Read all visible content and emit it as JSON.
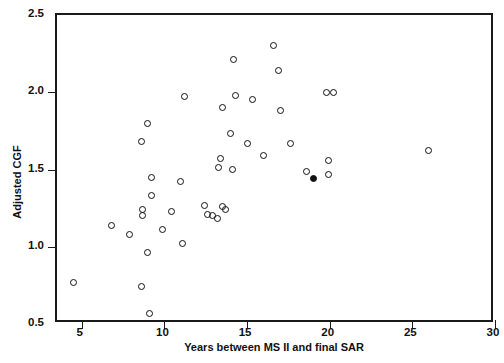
{
  "chart_data": {
    "type": "scatter",
    "title": "",
    "xlabel": "Years between MS II and final SAR",
    "ylabel": "Adjusted CGF",
    "xlim": [
      3.5,
      30
    ],
    "ylim": [
      0.5,
      2.5
    ],
    "xticks": [
      5,
      10,
      15,
      20,
      25,
      30
    ],
    "xticklabels": [
      "5",
      "10",
      "15",
      "20",
      "25",
      "30"
    ],
    "yticks": [
      0.5,
      1.0,
      1.5,
      2.0,
      2.5
    ],
    "yticklabels": [
      "0.5",
      "1.0",
      "1.5",
      "2.0",
      "2.5"
    ],
    "grid": false,
    "legend": null,
    "marker": "open-circle",
    "marker_color": "#111111",
    "points": [
      {
        "x": 4.5,
        "y": 0.77,
        "filled": false
      },
      {
        "x": 6.8,
        "y": 1.14,
        "filled": false
      },
      {
        "x": 7.9,
        "y": 1.08,
        "filled": false
      },
      {
        "x": 8.6,
        "y": 1.68,
        "filled": false
      },
      {
        "x": 9.0,
        "y": 1.8,
        "filled": false
      },
      {
        "x": 8.7,
        "y": 1.24,
        "filled": false
      },
      {
        "x": 8.7,
        "y": 1.2,
        "filled": false
      },
      {
        "x": 8.6,
        "y": 0.74,
        "filled": false
      },
      {
        "x": 9.0,
        "y": 0.96,
        "filled": false
      },
      {
        "x": 9.2,
        "y": 1.45,
        "filled": false
      },
      {
        "x": 9.2,
        "y": 1.33,
        "filled": false
      },
      {
        "x": 9.1,
        "y": 0.57,
        "filled": false
      },
      {
        "x": 9.9,
        "y": 1.11,
        "filled": false
      },
      {
        "x": 10.4,
        "y": 1.23,
        "filled": false
      },
      {
        "x": 11.2,
        "y": 1.97,
        "filled": false
      },
      {
        "x": 11.0,
        "y": 1.42,
        "filled": false
      },
      {
        "x": 11.1,
        "y": 1.02,
        "filled": false
      },
      {
        "x": 12.4,
        "y": 1.27,
        "filled": false
      },
      {
        "x": 12.6,
        "y": 1.21,
        "filled": false
      },
      {
        "x": 12.9,
        "y": 1.2,
        "filled": false
      },
      {
        "x": 13.2,
        "y": 1.18,
        "filled": false
      },
      {
        "x": 13.5,
        "y": 1.9,
        "filled": false
      },
      {
        "x": 13.4,
        "y": 1.57,
        "filled": false
      },
      {
        "x": 13.3,
        "y": 1.51,
        "filled": false
      },
      {
        "x": 13.5,
        "y": 1.26,
        "filled": false
      },
      {
        "x": 13.7,
        "y": 1.24,
        "filled": false
      },
      {
        "x": 14.2,
        "y": 2.21,
        "filled": false
      },
      {
        "x": 14.3,
        "y": 1.98,
        "filled": false
      },
      {
        "x": 14.0,
        "y": 1.73,
        "filled": false
      },
      {
        "x": 14.1,
        "y": 1.5,
        "filled": false
      },
      {
        "x": 15.0,
        "y": 1.67,
        "filled": false
      },
      {
        "x": 15.3,
        "y": 1.95,
        "filled": false
      },
      {
        "x": 16.0,
        "y": 1.59,
        "filled": false
      },
      {
        "x": 16.6,
        "y": 2.3,
        "filled": false
      },
      {
        "x": 16.9,
        "y": 2.14,
        "filled": false
      },
      {
        "x": 17.0,
        "y": 1.88,
        "filled": false
      },
      {
        "x": 17.6,
        "y": 1.67,
        "filled": false
      },
      {
        "x": 18.6,
        "y": 1.49,
        "filled": false
      },
      {
        "x": 19.0,
        "y": 1.44,
        "filled": true
      },
      {
        "x": 19.8,
        "y": 2.0,
        "filled": false
      },
      {
        "x": 20.2,
        "y": 2.0,
        "filled": false
      },
      {
        "x": 19.9,
        "y": 1.56,
        "filled": false
      },
      {
        "x": 19.9,
        "y": 1.47,
        "filled": false
      },
      {
        "x": 26.0,
        "y": 1.62,
        "filled": false
      }
    ]
  },
  "axes": {
    "x_title": "Years between MS II and final SAR",
    "y_title": "Adjusted CGF"
  }
}
